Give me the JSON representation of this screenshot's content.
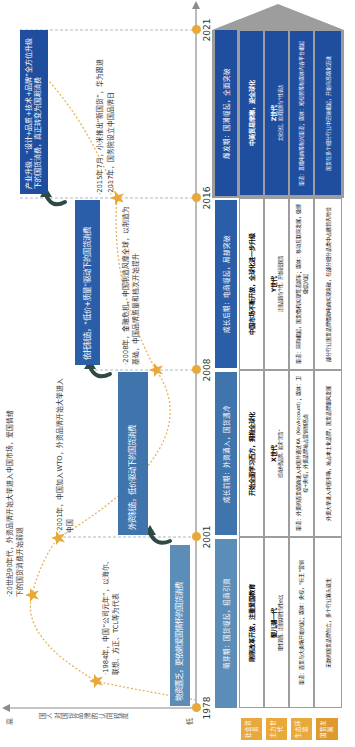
{
  "axis": {
    "y_label": "国人对国货品牌的认同程度",
    "y_high": "高",
    "y_low": "低",
    "years": [
      "1978",
      "2001",
      "2008",
      "2016",
      "2021"
    ]
  },
  "stage_boxes": [
    {
      "text": "物资匮乏，更依赖爱国情怀的国货消费",
      "color": "#5b8db8"
    },
    {
      "text": "外资制造，低价驱动下的国货消费",
      "color": "#3f74ad"
    },
    {
      "text": "依托制造，“低价+质量”驱动下的国货消费",
      "color": "#2a5ea8"
    },
    {
      "text": "产业升级，“设计+品质+技术+品牌”全方位升级下的国货消费，真正转变为国潮消费",
      "color": "#1f4e9e"
    }
  ],
  "events": [
    {
      "text": "·1984年，中国“公司元年”，以海尔、联想、方正、TCL等为代表"
    },
    {
      "text": "·20世纪90年代，外资品牌开始大举进入中国市场，爱国情绪下的国货消费开始弱退"
    },
    {
      "text": "·2001年，中国加入WTO，外资品牌开始大举进入中国"
    },
    {
      "text": "·2008年，金融危机，中国制造风靡全球，以制造为基础，中国品牌质量和档次开始提升"
    },
    {
      "text": "·2015年7月，小米推出“新国货”，华为跟进"
    },
    {
      "text": "·2017年，国务院设立中国品牌日"
    }
  ],
  "table": {
    "row_labels": [
      "社会背景",
      "主力世代",
      "生态环境",
      "国货发展"
    ],
    "stages": [
      {
        "header": "萌芽期：国货崛起，招商引资",
        "header_color": "#5b8db8",
        "dark": false,
        "social": "刚刚改革开放，注重爱国教育",
        "generation": "婴儿潮一代",
        "generation_note": "理性消费，注重实用性与性价比",
        "ecosystem": "渠道：百货与大卖场开始兴起；媒体：央视，“标王”营销",
        "development": "无数的国货品牌创立，多个行业寡头诞生"
      },
      {
        "header": "成长前期：外资涌入，国货遇冷",
        "header_color": "#3f74ad",
        "dark": false,
        "social": "开始全面学习西方，拥抱全球化",
        "generation": "X世代",
        "generation_note": "崇尚外资品牌，追求“洋货”",
        "ecosystem": "渠道：外资的百货/超商进入中国并通过KA（KeyAccount）；媒体：卫视+央视，外资品牌抢占营销制高点",
        "development": "外资大举进入中国市场，抢占本土化品牌，国货品牌跟风发展"
      },
      {
        "header": "成长后期：电商崛起，局部突破",
        "header_color": "#2a5ea8",
        "dark": false,
        "social": "中国市场不断开放，全球化进一步升级",
        "generation": "Y世代",
        "generation_note": "注重品质与个性，开始接受国货",
        "ecosystem": "渠道：网购崛起，国货借机实现弯道超车；媒体：移动互联网发展，微博微信兴起",
        "development": "部分行业国货品牌借助电商实现突破，在部分细分品类中占据领先地位"
      },
      {
        "header": "爆发期：国潮崛起，全面突破",
        "header_color": "#1f4e9e",
        "dark": true,
        "social": "中美贸易摩擦，逆全球化",
        "generation": "Z世代",
        "generation_note": "文化自信，追求国潮与个性表达",
        "ecosystem": "渠道：直播电商等新兴渠道；媒体：短视频等新媒体内容平台崛起",
        "development": "国货在多个细分行业中迅速崛起，开始向高端化迈进"
      }
    ]
  },
  "colors": {
    "accent_orange": "#e9a83a",
    "arrow_green": "#2f4a44",
    "navy": "#1f4e9e",
    "axis_gray": "#8c8c8c"
  }
}
